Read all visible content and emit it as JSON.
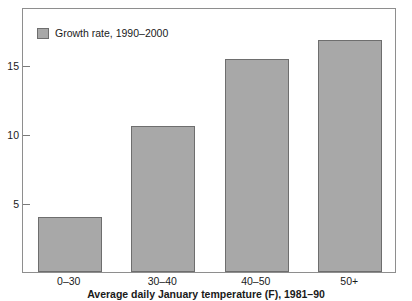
{
  "chart_data": {
    "type": "bar",
    "title": "",
    "subtitle": "",
    "xlabel": "Average daily January temperature (F), 1981–90",
    "ylabel": "",
    "categories": [
      "0–30",
      "30–40",
      "40–50",
      "50+"
    ],
    "series": [
      {
        "name": "Growth rate, 1990–2000",
        "values": [
          4.0,
          10.6,
          15.4,
          16.8
        ],
        "color": "#a8a8a8"
      }
    ],
    "ylim": [
      0,
      19.2
    ],
    "yticks": [
      5,
      10,
      15
    ],
    "ytick_labels": [
      "5",
      "10",
      "15"
    ],
    "grid": false,
    "legend": {
      "position": "top-left-inside",
      "entries": [
        {
          "label": "Growth rate, 1990–2000",
          "swatch_color": "#a8a8a8"
        }
      ]
    },
    "axis_colors": {
      "frame": "#8e8e8e",
      "tick": "#7a7a7a",
      "bar_fill": "#a8a8a8",
      "bar_border": "#6e6e6e",
      "text": "#1a1a1a"
    }
  },
  "legend": {
    "swatch_name": "legend-color-swatch",
    "label": "Growth rate, 1990–2000"
  },
  "y_axis": {
    "ticks": [
      {
        "label": "15",
        "value": 15
      },
      {
        "label": "10",
        "value": 10
      },
      {
        "label": "5",
        "value": 5
      }
    ]
  },
  "x_axis": {
    "title": "Average daily January temperature (F), 1981–90",
    "ticks": [
      {
        "label": "0–30"
      },
      {
        "label": "30–40"
      },
      {
        "label": "40–50"
      },
      {
        "label": "50+"
      }
    ]
  }
}
